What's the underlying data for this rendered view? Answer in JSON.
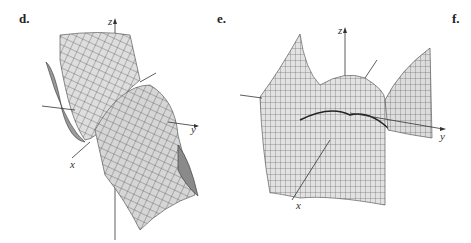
{
  "panels": [
    {
      "label": "d.",
      "axes": {
        "x": "x",
        "y": "y",
        "z": "z"
      },
      "surface": "saddle-like surface mesh"
    },
    {
      "label": "e.",
      "axes": {
        "x": "x",
        "y": "y",
        "z": "z"
      },
      "surface": "wavy surface with ridges and valleys"
    },
    {
      "label": "f.",
      "axes": {},
      "surface": ""
    }
  ],
  "colors": {
    "surface_fill": "#d8d8d8",
    "mesh": "#3a3a3a",
    "axis": "#333333"
  }
}
